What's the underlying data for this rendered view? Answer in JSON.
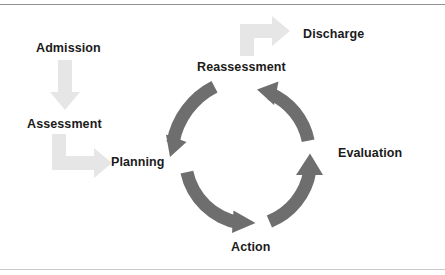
{
  "figure": {
    "type": "cycle-diagram",
    "background_color": "#ffffff",
    "width": 445,
    "height": 275
  },
  "colors": {
    "ring_arrow": "#6e6e6e",
    "entry_arrow": "#e6e6e6",
    "label_text": "#1b1b1b",
    "rule_top": "#8f8f8f",
    "rule_bottom": "#c9c9c9"
  },
  "labels": {
    "admission": "Admission",
    "assessment": "Assessment",
    "planning": "Planning",
    "reassessment": "Reassessment",
    "discharge": "Discharge",
    "evaluation": "Evaluation",
    "action": "Action"
  },
  "cycle": {
    "center": {
      "x": 247,
      "y": 158
    },
    "outer_radius": 72,
    "stroke_width": 13,
    "direction": "counterclockwise",
    "steps": [
      {
        "name": "Planning",
        "angle_deg": 180,
        "arrow_points": "down-left"
      },
      {
        "name": "Action",
        "angle_deg": 90,
        "arrow_points": "right"
      },
      {
        "name": "Evaluation",
        "angle_deg": 0,
        "arrow_points": "up"
      },
      {
        "name": "Reassessment",
        "angle_deg": 270,
        "arrow_points": "up-left"
      }
    ]
  },
  "entry_arrows": [
    {
      "name": "admission-to-assessment",
      "shape": "straight-down",
      "color": "#e6e6e6"
    },
    {
      "name": "assessment-to-planning",
      "shape": "elbow-down-right",
      "color": "#e6e6e6"
    },
    {
      "name": "reassessment-to-discharge",
      "shape": "elbow-up-right",
      "color": "#e6e6e6"
    }
  ]
}
